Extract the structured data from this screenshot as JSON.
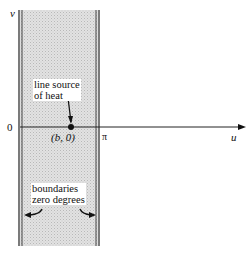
{
  "diagram": {
    "axes": {
      "vertical_label": "v",
      "horizontal_label": "u",
      "origin_label": "0",
      "pi_label": "π"
    },
    "point": {
      "label": "(b, 0)"
    },
    "annotations": {
      "source_line1": "line source",
      "source_line2": "of heat",
      "boundary_line1": "boundaries",
      "boundary_line2": "zero degrees"
    },
    "colors": {
      "strip_fill": "#d4d4d4",
      "lines": "#222222",
      "background": "#ffffff"
    }
  }
}
